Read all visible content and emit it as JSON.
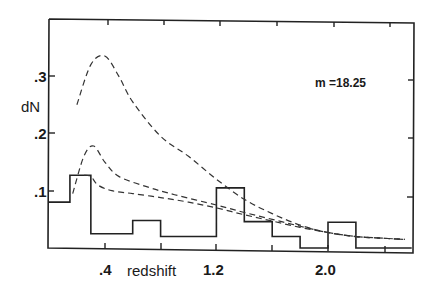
{
  "chart_data": {
    "type": "line",
    "title": "",
    "xlabel": "redshift",
    "ylabel": "dN",
    "annotation": "m =18.25",
    "xlim": [
      0.0,
      2.6
    ],
    "ylim": [
      0.0,
      0.4
    ],
    "x_ticks": [
      0.4,
      0.8,
      1.2,
      1.6,
      2.0,
      2.4
    ],
    "x_tick_labels": [
      ".4",
      "",
      "1.2",
      "",
      "2.0",
      ""
    ],
    "y_ticks": [
      0.1,
      0.2,
      0.3
    ],
    "y_tick_labels": [
      ".1",
      ".2",
      ".3"
    ],
    "grid": false,
    "legend": null,
    "histogram": {
      "name": "observed",
      "style": "solid-step",
      "bin_edges": [
        0.0,
        0.15,
        0.3,
        0.6,
        0.8,
        1.2,
        1.4,
        1.6,
        1.8,
        2.0,
        2.2,
        2.6
      ],
      "values": [
        0.08,
        0.127,
        0.025,
        0.048,
        0.02,
        0.105,
        0.046,
        0.02,
        0.0,
        0.045,
        0.0
      ]
    },
    "series": [
      {
        "name": "model-high",
        "style": "dashed",
        "x": [
          0.2,
          0.3,
          0.4,
          0.5,
          0.6,
          0.8,
          1.0,
          1.2,
          1.4,
          1.6,
          1.8,
          2.0,
          2.2,
          2.4,
          2.55
        ],
        "values": [
          0.25,
          0.32,
          0.335,
          0.3,
          0.255,
          0.195,
          0.16,
          0.12,
          0.085,
          0.06,
          0.04,
          0.027,
          0.02,
          0.017,
          0.015
        ]
      },
      {
        "name": "model-mid",
        "style": "dashed",
        "x": [
          0.17,
          0.25,
          0.32,
          0.4,
          0.5,
          0.7,
          0.9,
          1.2,
          1.4,
          1.6,
          1.8,
          2.0,
          2.2,
          2.4,
          2.55
        ],
        "values": [
          0.095,
          0.16,
          0.178,
          0.15,
          0.125,
          0.107,
          0.093,
          0.075,
          0.062,
          0.05,
          0.038,
          0.027,
          0.02,
          0.017,
          0.015
        ]
      },
      {
        "name": "model-low",
        "style": "dashed",
        "x": [
          0.25,
          0.3,
          0.35,
          0.45,
          0.6,
          0.8,
          1.0,
          1.2,
          1.4,
          1.6,
          1.8,
          2.0,
          2.2,
          2.4,
          2.55
        ],
        "values": [
          0.127,
          0.125,
          0.11,
          0.1,
          0.095,
          0.088,
          0.08,
          0.07,
          0.058,
          0.047,
          0.036,
          0.027,
          0.02,
          0.017,
          0.015
        ]
      }
    ]
  },
  "labels": {
    "ylabel": "dN",
    "xlabel": "redshift",
    "annotation": "m =18.25",
    "ytick_3": ".3",
    "ytick_2": ".2",
    "ytick_1": ".1",
    "xtick_04": ".4",
    "xtick_12": "1.2",
    "xtick_20": "2.0"
  }
}
